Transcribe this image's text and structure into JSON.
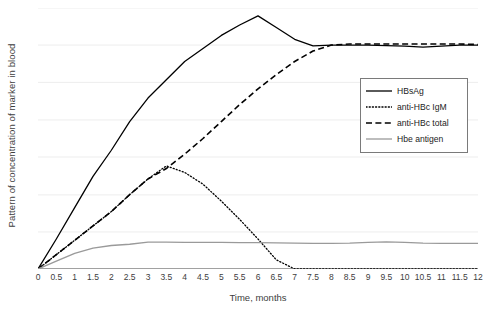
{
  "chart_data": {
    "type": "line",
    "title": "",
    "xlabel": "Time, months",
    "ylabel": "Pattern of concentration of marker in blood",
    "xlim": [
      0,
      12
    ],
    "ylim": [
      0,
      100
    ],
    "grid": true,
    "y_gridlines": [
      0,
      14.2,
      28.4,
      42.9,
      57.1,
      71.5,
      85.8,
      100
    ],
    "y_ticklabels": [],
    "legend_position": "right-upper",
    "xticks": [
      "0",
      "0.5",
      "1",
      "1.5",
      "2",
      "2.5",
      "3",
      "3.5",
      "4",
      "4.5",
      "5",
      "5.5",
      "6",
      "6.5",
      "7",
      "7.5",
      "8",
      "8.5",
      "9",
      "9.5",
      "10",
      "10.5",
      "11",
      "11.5",
      "12"
    ],
    "x": [
      0,
      0.5,
      1,
      1.5,
      2,
      2.5,
      3,
      3.5,
      4,
      4.5,
      5,
      5.5,
      6,
      6.5,
      7,
      7.5,
      8,
      8.5,
      9,
      9.5,
      10,
      10.5,
      11,
      11.5,
      12
    ],
    "series": [
      {
        "name": "HBsAg",
        "style": "solid",
        "color": "#000000",
        "width": 1.3,
        "values": [
          0,
          11.5,
          23.5,
          35.5,
          45.5,
          56.5,
          65.5,
          72.5,
          79.5,
          84.5,
          89.5,
          93.5,
          97.0,
          92.5,
          88.0,
          85.5,
          85.8,
          85.8,
          85.8,
          85.6,
          85.4,
          85.0,
          85.4,
          85.8,
          85.8
        ]
      },
      {
        "name": "anti-HBc IgM",
        "style": "dotted",
        "color": "#000000",
        "width": 1.3,
        "values": [
          0,
          5.5,
          11.0,
          16.5,
          22.0,
          28.5,
          34.5,
          39.5,
          37.0,
          32.5,
          26.0,
          19.0,
          11.5,
          3.5,
          0,
          0,
          0,
          0,
          0,
          0,
          0,
          0,
          0,
          0,
          0
        ]
      },
      {
        "name": "anti-HBc total",
        "style": "dashed",
        "color": "#000000",
        "width": 1.6,
        "values": [
          0,
          5.5,
          11.0,
          16.5,
          22.0,
          28.5,
          34.5,
          38.5,
          44.0,
          50.0,
          56.5,
          63.0,
          69.0,
          74.5,
          79.5,
          83.5,
          85.8,
          86.2,
          86.2,
          86.2,
          86.2,
          86.2,
          86.2,
          86.2,
          86.0
        ]
      },
      {
        "name": "Hbe antigen",
        "style": "solid",
        "color": "#9a9a9a",
        "width": 1.4,
        "values": [
          0,
          3.0,
          6.0,
          8.0,
          9.0,
          9.5,
          10.3,
          10.3,
          10.2,
          10.2,
          10.2,
          10.1,
          10.1,
          10.0,
          9.9,
          9.8,
          9.8,
          9.9,
          10.2,
          10.4,
          10.2,
          9.9,
          9.8,
          9.8,
          9.8
        ]
      }
    ]
  },
  "legend": {
    "items": [
      {
        "label": "HBsAg",
        "style": "solid",
        "color": "#000000"
      },
      {
        "label": "anti-HBc IgM",
        "style": "dotted",
        "color": "#000000"
      },
      {
        "label": "anti-HBc total",
        "style": "dashed",
        "color": "#000000"
      },
      {
        "label": "Hbe antigen",
        "style": "solid",
        "color": "#9a9a9a"
      }
    ]
  },
  "style": {
    "grid_color": "#ededed",
    "axis_color": "#4d4d4d",
    "text_color": "#3d3d3d",
    "background": "#ffffff"
  }
}
